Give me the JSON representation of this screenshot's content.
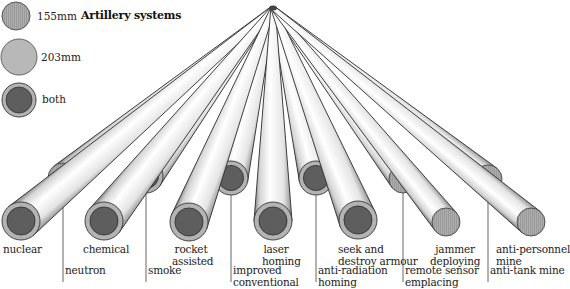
{
  "title": "Artillery systems",
  "legend": [
    {
      "key": "155mm",
      "label": "155mm",
      "fill": "#a9a9a9",
      "type": "hatched"
    },
    {
      "key": "203mm",
      "label": "203mm",
      "fill": "#b9b9b9",
      "type": "plain"
    },
    {
      "key": "both",
      "label": "both",
      "fill": "#6a6a6a",
      "type": "ring"
    }
  ],
  "apex": {
    "x": 273,
    "y": 8
  },
  "tubes_back": [
    {
      "id": "neutron",
      "label": "neutron",
      "type": "155mm",
      "cx": 63,
      "cy": 178,
      "r": 15
    },
    {
      "id": "smoke",
      "label": "smoke",
      "type": "both",
      "cx": 146,
      "cy": 176,
      "r": 17
    },
    {
      "id": "improved-conventional",
      "label": "improved conventional",
      "type": "both",
      "cx": 231,
      "cy": 178,
      "r": 17
    },
    {
      "id": "anti-radiation-homing",
      "label": "anti-radiation homing",
      "type": "both",
      "cx": 316,
      "cy": 178,
      "r": 17
    },
    {
      "id": "remote-sensor-emplacing",
      "label": "remote sensor emplacing",
      "type": "155mm",
      "cx": 403,
      "cy": 179,
      "r": 14
    },
    {
      "id": "anti-tank-mine",
      "label": "anti-tank mine",
      "type": "155mm",
      "cx": 488,
      "cy": 179,
      "r": 14
    }
  ],
  "tubes_front": [
    {
      "id": "nuclear",
      "label": "nuclear",
      "type": "both",
      "cx": 21,
      "cy": 221,
      "r": 19
    },
    {
      "id": "chemical",
      "label": "chemical",
      "type": "both",
      "cx": 104,
      "cy": 221,
      "r": 19
    },
    {
      "id": "rocket-assisted",
      "label": "rocket assisted",
      "type": "both",
      "cx": 189,
      "cy": 222,
      "r": 19
    },
    {
      "id": "laser-homing",
      "label": "laser homing",
      "type": "both",
      "cx": 273,
      "cy": 221,
      "r": 19
    },
    {
      "id": "seek-and-destroy-armour",
      "label": "seek and destroy armour",
      "type": "both",
      "cx": 358,
      "cy": 220,
      "r": 19
    },
    {
      "id": "jammer-deploying",
      "label": "jammer deploying",
      "type": "155mm",
      "cx": 446,
      "cy": 222,
      "r": 14
    },
    {
      "id": "anti-personnel-mine",
      "label": "anti-personnel mine",
      "type": "155mm",
      "cx": 531,
      "cy": 222,
      "r": 14
    }
  ],
  "labels": {
    "nuclear": "nuclear",
    "neutron": "neutron",
    "chemical": "chemical",
    "smoke": "smoke",
    "rocket_1": "rocket",
    "rocket_2": "assisted",
    "improved_1": "improved",
    "improved_2": "conventional",
    "laser_1": "laser",
    "laser_2": "homing",
    "antirad_1": "anti-radiation",
    "antirad_2": "homing",
    "seek_1": "seek and",
    "seek_2": "destroy armour",
    "remote_1": "remote sensor",
    "remote_2": "emplacing",
    "jammer_1": "jammer",
    "jammer_2": "deploying",
    "antipers_1": "anti-personnel",
    "antipers_2": "mine",
    "antitank": "anti-tank mine"
  },
  "colors": {
    "tube_outline": "#2a2a2a",
    "tube_body_light": "#ffffff",
    "tube_body_shade": "#8a8a8a",
    "ring": "#b3b3b3",
    "core": "#5e5e5e",
    "hatch": "#a6a6a6",
    "leader": "#555555"
  }
}
